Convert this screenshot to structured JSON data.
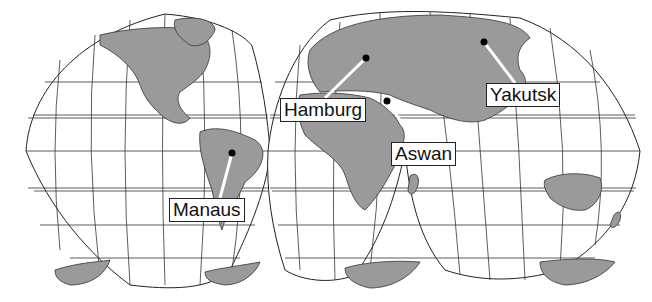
{
  "map": {
    "projection": "interrupted Goode homolosine",
    "colors": {
      "land": "#9a9a9a",
      "ocean": "#ffffff",
      "grid": "#222222",
      "marker": "#000000"
    },
    "cities": [
      {
        "name": "Hamburg",
        "marker": [
          366,
          58
        ],
        "label_pos": [
          280,
          98
        ]
      },
      {
        "name": "Aswan",
        "marker": [
          387,
          101
        ],
        "label_pos": [
          391,
          142
        ]
      },
      {
        "name": "Yakutsk",
        "marker": [
          484,
          42
        ],
        "label_pos": [
          486,
          83
        ]
      },
      {
        "name": "Manaus",
        "marker": [
          232,
          153
        ],
        "label_pos": [
          169,
          198
        ]
      }
    ]
  }
}
